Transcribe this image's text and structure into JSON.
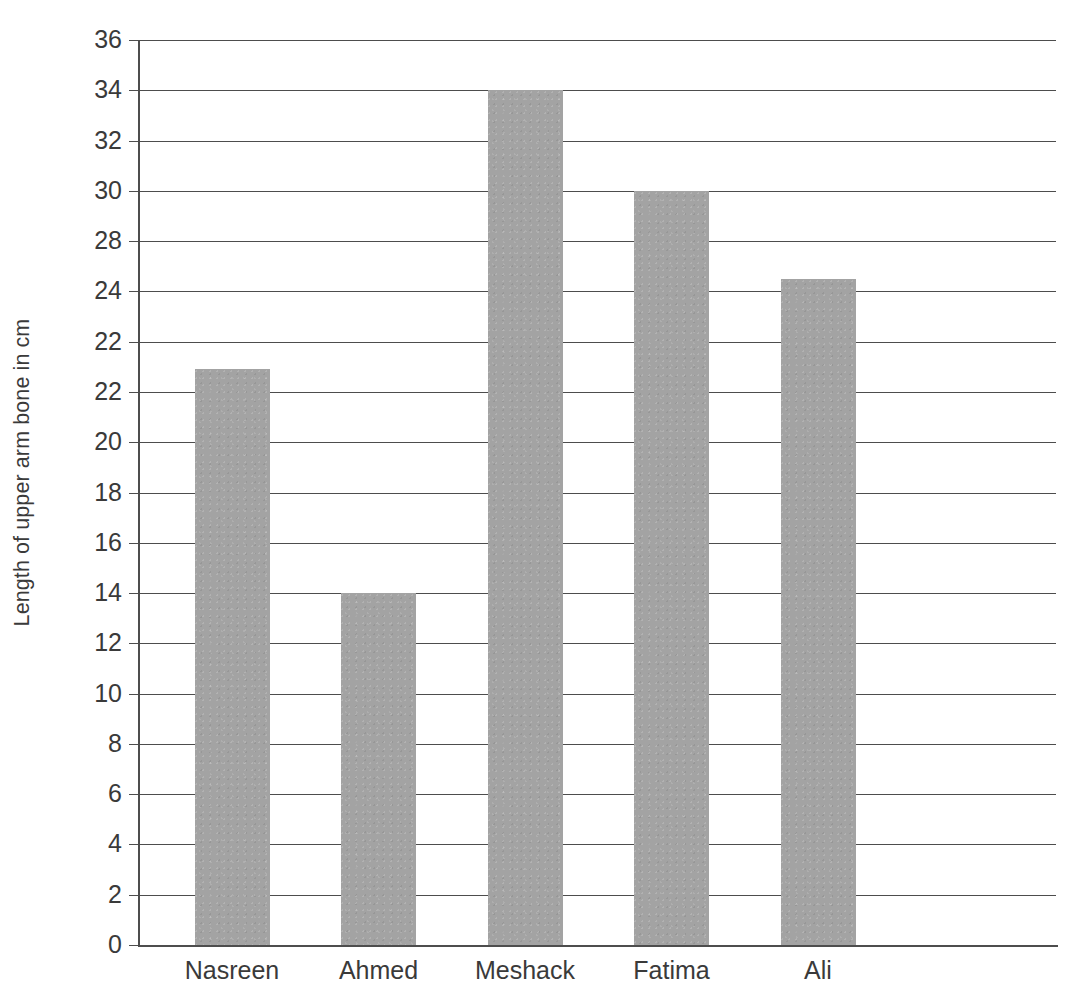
{
  "chart_data": {
    "type": "bar",
    "title": "",
    "subtitle": "",
    "xlabel": "",
    "ylabel": "Length of upper arm bone in cm",
    "categories": [
      "Nasreen",
      "Ahmed",
      "Meshack",
      "Fatima",
      "Ali"
    ],
    "values": [
      22.9,
      14,
      34,
      30,
      26.5
    ],
    "series": [
      {
        "name": "Length of upper arm bone",
        "values": [
          22.9,
          14,
          34,
          30,
          26.5
        ]
      }
    ],
    "ylim": [
      0,
      36
    ],
    "ytick_step": 2,
    "ytick_positions": [
      36,
      34,
      32,
      30,
      28,
      26,
      24,
      22,
      20,
      18,
      16,
      14,
      12,
      10,
      8,
      6,
      4,
      2,
      0
    ],
    "ytick_labels": [
      "36",
      "34",
      "32",
      "30",
      "28",
      "24",
      "22",
      "22",
      "20",
      "18",
      "16",
      "14",
      "12",
      "10",
      "8",
      "6",
      "4",
      "2",
      "0"
    ],
    "grid": true,
    "grid_axis": "y",
    "legend": false,
    "legend_position": "none",
    "bar_color": "#a3a3a3",
    "axis_color": "#4d4d4d",
    "text_color": "#3a3a3a",
    "background_color": "#ffffff",
    "annotations": []
  }
}
